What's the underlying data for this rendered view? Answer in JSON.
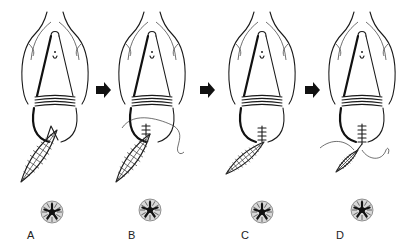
{
  "figure": {
    "panels": [
      {
        "label": "A",
        "cx": 55,
        "rosette": [
          52,
          212
        ],
        "label_pos": [
          27,
          229
        ],
        "stage": "wound-open"
      },
      {
        "label": "B",
        "cx": 152,
        "rosette": [
          150,
          210
        ],
        "label_pos": [
          128,
          229
        ],
        "stage": "suture-placed"
      },
      {
        "label": "C",
        "cx": 262,
        "rosette": [
          262,
          212
        ],
        "label_pos": [
          241,
          229
        ],
        "stage": "partially-closed"
      },
      {
        "label": "D",
        "cx": 362,
        "rosette": [
          362,
          210
        ],
        "label_pos": [
          336,
          229
        ],
        "stage": "closure-with-thread"
      }
    ],
    "arrows": [
      {
        "x": 96,
        "y": 90
      },
      {
        "x": 200,
        "y": 90
      },
      {
        "x": 305,
        "y": 90
      }
    ],
    "colors": {
      "ink": "#1a1a1a",
      "background": "#ffffff"
    }
  }
}
